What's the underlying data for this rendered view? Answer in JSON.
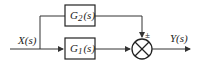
{
  "diagram": {
    "type": "block-diagram",
    "input": {
      "label": "X(s)"
    },
    "output": {
      "label": "Y(s)"
    },
    "blocks": [
      {
        "id": "G2",
        "label": "G",
        "sub": "2",
        "arg": "(s)"
      },
      {
        "id": "G1",
        "label": "G",
        "sub": "1",
        "arg": "(s)"
      }
    ],
    "summing_junction": {
      "sign": "±"
    },
    "colors": {
      "line": "#333333",
      "background": "#ffffff"
    }
  }
}
